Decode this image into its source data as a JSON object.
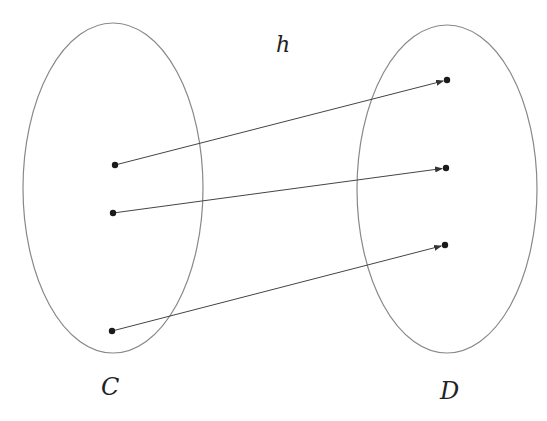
{
  "diagram": {
    "function_label": "h",
    "domain_set": {
      "label": "C",
      "cx": 113,
      "cy": 188,
      "rx": 90,
      "ry": 165
    },
    "codomain_set": {
      "label": "D",
      "cx": 447,
      "cy": 189,
      "rx": 90,
      "ry": 164
    },
    "domain_points": [
      {
        "x": 115,
        "y": 165
      },
      {
        "x": 113,
        "y": 213
      },
      {
        "x": 112,
        "y": 331
      }
    ],
    "codomain_points": [
      {
        "x": 447,
        "y": 80
      },
      {
        "x": 446,
        "y": 168
      },
      {
        "x": 445,
        "y": 245
      }
    ],
    "mappings": [
      {
        "from": 0,
        "to": 0
      },
      {
        "from": 1,
        "to": 1
      },
      {
        "from": 2,
        "to": 2
      }
    ],
    "colors": {
      "ellipse": "#888888",
      "line": "#444444",
      "point": "#1a1a1a",
      "text": "#222222"
    }
  }
}
